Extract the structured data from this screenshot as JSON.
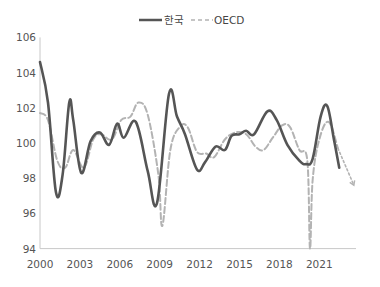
{
  "legend": {
    "korea_label": "한국",
    "oecd_label": "OECD"
  },
  "chart_data": {
    "type": "line",
    "title": "",
    "xlabel": "",
    "ylabel": "",
    "ylim": [
      94,
      106
    ],
    "xlim": [
      2000,
      2023.8
    ],
    "yticks": [
      94,
      96,
      98,
      100,
      102,
      104,
      106
    ],
    "xticks": [
      2000,
      2003,
      2006,
      2009,
      2012,
      2015,
      2018,
      2021
    ],
    "grid": false,
    "legend_position": "top-center",
    "colors": {
      "korea": "#555555",
      "oecd": "#b3b3b3",
      "axis": "#c8c8c8"
    },
    "series": [
      {
        "name": "한국",
        "style": "solid",
        "points": [
          [
            2000.0,
            104.6
          ],
          [
            2000.6,
            102.3
          ],
          [
            2001.2,
            97.2
          ],
          [
            2001.7,
            98.2
          ],
          [
            2002.2,
            102.3
          ],
          [
            2002.5,
            101.3
          ],
          [
            2003.1,
            98.3
          ],
          [
            2003.8,
            100.1
          ],
          [
            2004.5,
            100.6
          ],
          [
            2005.2,
            99.9
          ],
          [
            2005.8,
            101.1
          ],
          [
            2006.3,
            100.3
          ],
          [
            2007.2,
            101.2
          ],
          [
            2008.1,
            98.4
          ],
          [
            2008.8,
            96.6
          ],
          [
            2009.7,
            102.8
          ],
          [
            2010.3,
            101.5
          ],
          [
            2010.9,
            100.5
          ],
          [
            2011.8,
            98.5
          ],
          [
            2012.4,
            98.9
          ],
          [
            2013.2,
            99.8
          ],
          [
            2013.9,
            99.6
          ],
          [
            2014.4,
            100.4
          ],
          [
            2015.0,
            100.5
          ],
          [
            2015.5,
            100.7
          ],
          [
            2016.1,
            100.5
          ],
          [
            2017.1,
            101.8
          ],
          [
            2017.8,
            101.3
          ],
          [
            2018.6,
            99.9
          ],
          [
            2019.5,
            99.0
          ],
          [
            2020.0,
            98.8
          ],
          [
            2020.5,
            99.1
          ],
          [
            2021.1,
            101.5
          ],
          [
            2021.6,
            102.1
          ],
          [
            2022.1,
            100.2
          ],
          [
            2022.5,
            98.6
          ]
        ]
      },
      {
        "name": "OECD",
        "style": "dashed",
        "points": [
          [
            2000.0,
            101.7
          ],
          [
            2000.6,
            101.3
          ],
          [
            2001.3,
            99.0
          ],
          [
            2001.9,
            98.6
          ],
          [
            2002.5,
            99.6
          ],
          [
            2003.3,
            98.6
          ],
          [
            2004.0,
            100.2
          ],
          [
            2004.6,
            100.5
          ],
          [
            2005.4,
            100.2
          ],
          [
            2006.1,
            101.3
          ],
          [
            2006.8,
            101.5
          ],
          [
            2007.4,
            102.3
          ],
          [
            2008.1,
            101.6
          ],
          [
            2008.9,
            98.2
          ],
          [
            2009.2,
            95.3
          ],
          [
            2009.8,
            99.6
          ],
          [
            2010.5,
            100.9
          ],
          [
            2011.1,
            100.9
          ],
          [
            2011.8,
            99.5
          ],
          [
            2012.5,
            99.4
          ],
          [
            2013.1,
            99.2
          ],
          [
            2013.9,
            100.2
          ],
          [
            2014.7,
            100.6
          ],
          [
            2015.5,
            100.5
          ],
          [
            2016.2,
            99.8
          ],
          [
            2016.8,
            99.6
          ],
          [
            2017.5,
            100.3
          ],
          [
            2018.2,
            101.0
          ],
          [
            2018.8,
            100.9
          ],
          [
            2019.5,
            99.6
          ],
          [
            2020.1,
            99.0
          ],
          [
            2020.3,
            94.0
          ],
          [
            2020.5,
            97.9
          ],
          [
            2021.0,
            100.2
          ],
          [
            2021.7,
            101.2
          ],
          [
            2022.4,
            99.7
          ]
        ]
      },
      {
        "name": "OECD projection",
        "style": "dotted",
        "points": [
          [
            2022.4,
            99.7
          ],
          [
            2023.6,
            97.6
          ]
        ]
      }
    ]
  }
}
